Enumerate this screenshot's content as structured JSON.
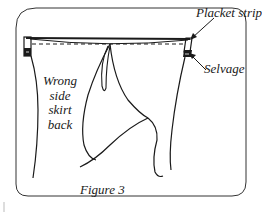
{
  "figure": {
    "caption": "Figure 3",
    "labels": {
      "placket_strip": "Placket strip",
      "selvage": "Selvage",
      "fabric_side": [
        "Wrong",
        "side",
        "skirt",
        "back"
      ]
    },
    "colors": {
      "line": "#1a1a1a",
      "frame": "#333333",
      "background": "#ffffff"
    }
  }
}
